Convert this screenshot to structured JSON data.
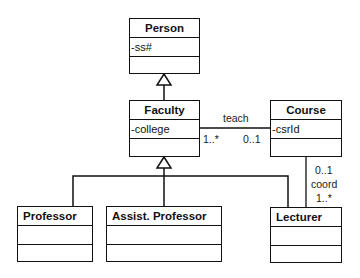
{
  "diagram": {
    "type": "UML class diagram",
    "classes": [
      {
        "name": "Person",
        "attributes": [
          "-ss#"
        ],
        "operations": []
      },
      {
        "name": "Faculty",
        "attributes": [
          "-college"
        ],
        "operations": []
      },
      {
        "name": "Course",
        "attributes": [
          "-csrId"
        ],
        "operations": []
      },
      {
        "name": "Professor",
        "attributes": [],
        "operations": []
      },
      {
        "name": "Assist. Professor",
        "attributes": [],
        "operations": []
      },
      {
        "name": "Lecturer",
        "attributes": [],
        "operations": []
      }
    ],
    "associations": [
      {
        "name": "teach",
        "from": "Faculty",
        "to": "Course",
        "from_multiplicity": "1..*",
        "to_multiplicity": "0..1"
      },
      {
        "name": "coord",
        "from": "Course",
        "to": "Lecturer",
        "from_multiplicity": "0..1",
        "to_multiplicity": "1..*"
      }
    ],
    "generalizations": [
      {
        "child": "Faculty",
        "parent": "Person"
      },
      {
        "child": "Professor",
        "parent": "Faculty"
      },
      {
        "child": "Assist. Professor",
        "parent": "Faculty"
      },
      {
        "child": "Lecturer",
        "parent": "Faculty"
      }
    ],
    "labels": {
      "person": "Person",
      "person_attr": "-ss#",
      "faculty": "Faculty",
      "faculty_attr": "-college",
      "course": "Course",
      "course_attr": "-csrId",
      "professor": "Professor",
      "assist_professor": "Assist. Professor",
      "lecturer": "Lecturer",
      "teach": "teach",
      "teach_faculty_mult": "1..*",
      "teach_course_mult": "0..1",
      "coord": "coord",
      "coord_course_mult": "0..1",
      "coord_lecturer_mult": "1..*"
    }
  }
}
